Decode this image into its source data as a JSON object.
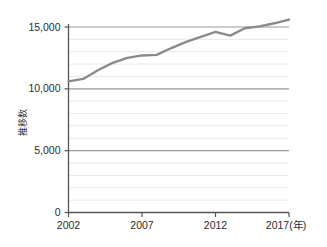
{
  "chart_data": {
    "type": "line",
    "title": "",
    "xlabel": "(年)",
    "ylabel": "推移数",
    "xlim": [
      2002,
      2017
    ],
    "ylim": [
      0,
      16000
    ],
    "xticks": [
      "2002",
      "2007",
      "2012",
      "2017"
    ],
    "xtick_values": [
      2002,
      2007,
      2012,
      2017
    ],
    "x_unit_suffix": "(年)",
    "yticks": [
      "0",
      "5,000",
      "10,000",
      "15,000"
    ],
    "ytick_values": [
      0,
      5000,
      10000,
      15000
    ],
    "grid": true,
    "grid_minor_step": 1000,
    "grid_major_step": 5000,
    "legend": "none",
    "x": [
      2002,
      2003,
      2004,
      2005,
      2006,
      2007,
      2008,
      2009,
      2010,
      2011,
      2012,
      2013,
      2014,
      2015,
      2016,
      2017
    ],
    "values": [
      10600,
      10800,
      11500,
      12100,
      12500,
      12700,
      12750,
      13300,
      13800,
      14200,
      14600,
      14300,
      14900,
      15050,
      15300,
      15600
    ],
    "series": [
      {
        "name": "推移数",
        "color": "#8a8a8a",
        "values": [
          10600,
          10800,
          11500,
          12100,
          12500,
          12700,
          12750,
          13300,
          13800,
          14200,
          14600,
          14300,
          14900,
          15050,
          15300,
          15600
        ]
      }
    ],
    "colors": {
      "line": "#8a8a8a",
      "axis": "#555555",
      "grid_minor": "#e9e9e9",
      "grid_major": "#9a9a9a",
      "text": "#2b2b2b",
      "background": "#ffffff"
    }
  }
}
